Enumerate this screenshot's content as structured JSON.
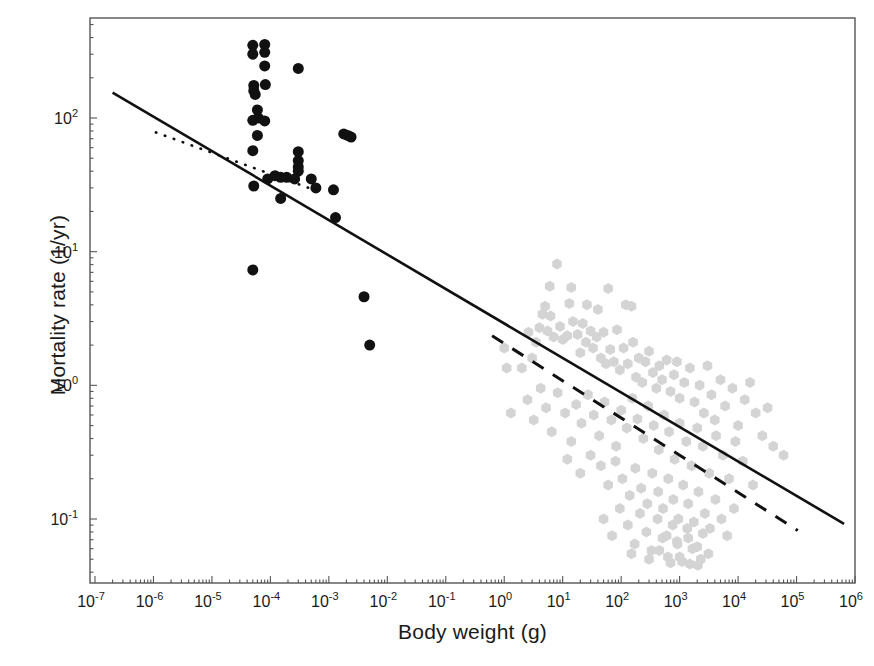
{
  "chart_data": {
    "type": "scatter",
    "title": "",
    "xlabel": "Body weight (g)",
    "ylabel": "Mortality rate (1/yr)",
    "xscale": "log",
    "yscale": "log",
    "xlim": [
      1e-07,
      1000000.0
    ],
    "ylim": [
      0.042,
      560
    ],
    "grid": false,
    "legend": "none",
    "xticks": [
      {
        "value": 1e-07,
        "label": "10",
        "exp": "-7"
      },
      {
        "value": 1e-06,
        "label": "10",
        "exp": "-6"
      },
      {
        "value": 1e-05,
        "label": "10",
        "exp": "-5"
      },
      {
        "value": 0.0001,
        "label": "10",
        "exp": "-4"
      },
      {
        "value": 0.001,
        "label": "10",
        "exp": "-3"
      },
      {
        "value": 0.01,
        "label": "10",
        "exp": "-2"
      },
      {
        "value": 0.1,
        "label": "10",
        "exp": "-1"
      },
      {
        "value": 1,
        "label": "10",
        "exp": "0"
      },
      {
        "value": 10,
        "label": "10",
        "exp": "1"
      },
      {
        "value": 100,
        "label": "10",
        "exp": "2"
      },
      {
        "value": 1000,
        "label": "10",
        "exp": "3"
      },
      {
        "value": 10000,
        "label": "10",
        "exp": "4"
      },
      {
        "value": 100000,
        "label": "10",
        "exp": "5"
      },
      {
        "value": 1000000,
        "label": "10",
        "exp": "6"
      }
    ],
    "yticks": [
      {
        "value": 100,
        "label": "10",
        "exp": "2"
      },
      {
        "value": 10,
        "label": "10",
        "exp": "1"
      },
      {
        "value": 1,
        "label": "10",
        "exp": "0"
      },
      {
        "value": 0.1,
        "label": "10",
        "exp": "-1"
      }
    ],
    "series": [
      {
        "name": "small-organisms",
        "marker": "filled-circle",
        "color": "#111111",
        "size": 11,
        "points": [
          [
            5e-05,
            350
          ],
          [
            5e-05,
            300
          ],
          [
            8e-05,
            355
          ],
          [
            8e-05,
            310
          ],
          [
            8e-05,
            245
          ],
          [
            5.2e-05,
            175
          ],
          [
            5.2e-05,
            160
          ],
          [
            5.5e-05,
            150
          ],
          [
            8.2e-05,
            178
          ],
          [
            0.0003,
            235
          ],
          [
            6e-05,
            115
          ],
          [
            6.2e-05,
            100
          ],
          [
            5e-05,
            96
          ],
          [
            8e-05,
            95
          ],
          [
            6e-05,
            74
          ],
          [
            5e-05,
            57
          ],
          [
            0.0018,
            76
          ],
          [
            0.0021,
            74
          ],
          [
            0.0024,
            72
          ],
          [
            0.0003,
            56
          ],
          [
            0.0003,
            48
          ],
          [
            0.0003,
            43
          ],
          [
            0.0003,
            40
          ],
          [
            0.00012,
            37
          ],
          [
            0.00015,
            36
          ],
          [
            0.00019,
            36
          ],
          [
            9e-05,
            35
          ],
          [
            0.00026,
            35
          ],
          [
            0.0005,
            35
          ],
          [
            5.2e-05,
            31
          ],
          [
            0.0006,
            30
          ],
          [
            0.0012,
            29
          ],
          [
            0.00015,
            25
          ],
          [
            0.0013,
            18
          ],
          [
            5e-05,
            7.3
          ],
          [
            0.004,
            4.6
          ],
          [
            0.005,
            2.0
          ]
        ]
      },
      {
        "name": "large-organisms",
        "marker": "filled-hexagon",
        "color": "#d4d4d4",
        "size": 11,
        "points": [
          [
            8.0,
            8.1
          ],
          [
            6.0,
            5.5
          ],
          [
            14.0,
            5.4
          ],
          [
            60.0,
            5.3
          ],
          [
            5.0,
            3.9
          ],
          [
            4.5,
            3.4
          ],
          [
            6.2,
            3.3
          ],
          [
            13.0,
            4.1
          ],
          [
            26.0,
            4.0
          ],
          [
            40.0,
            3.7
          ],
          [
            120.0,
            4.0
          ],
          [
            150.0,
            3.9
          ],
          [
            1.0,
            1.9
          ],
          [
            1.1,
            1.35
          ],
          [
            1.3,
            0.62
          ],
          [
            2.0,
            1.35
          ],
          [
            2.6,
            2.5
          ],
          [
            3.0,
            1.6
          ],
          [
            3.5,
            2.1
          ],
          [
            4.0,
            2.7
          ],
          [
            5.5,
            2.55
          ],
          [
            7.0,
            2.3
          ],
          [
            9.0,
            2.75
          ],
          [
            10.0,
            2.2
          ],
          [
            12.0,
            2.35
          ],
          [
            15.0,
            3.0
          ],
          [
            18.0,
            2.4
          ],
          [
            20.0,
            1.75
          ],
          [
            22.0,
            2.9
          ],
          [
            25.0,
            2.1
          ],
          [
            30.0,
            2.55
          ],
          [
            33.0,
            1.9
          ],
          [
            38.0,
            2.3
          ],
          [
            45.0,
            1.6
          ],
          [
            50.0,
            2.5
          ],
          [
            55.0,
            1.45
          ],
          [
            65.0,
            1.85
          ],
          [
            75.0,
            1.5
          ],
          [
            85.0,
            2.6
          ],
          [
            95.0,
            1.3
          ],
          [
            110.0,
            1.9
          ],
          [
            130.0,
            1.45
          ],
          [
            160.0,
            2.1
          ],
          [
            180.0,
            1.15
          ],
          [
            200.0,
            1.6
          ],
          [
            230.0,
            1.05
          ],
          [
            260.0,
            1.5
          ],
          [
            300.0,
            1.8
          ],
          [
            350.0,
            1.25
          ],
          [
            400.0,
            0.95
          ],
          [
            450.0,
            1.4
          ],
          [
            500.0,
            1.1
          ],
          [
            600.0,
            1.55
          ],
          [
            700.0,
            0.9
          ],
          [
            800.0,
            1.2
          ],
          [
            900.0,
            1.5
          ],
          [
            1000.0,
            0.8
          ],
          [
            1200.0,
            1.05
          ],
          [
            1500.0,
            1.35
          ],
          [
            1800.0,
            0.75
          ],
          [
            2200.0,
            1.0
          ],
          [
            2600.0,
            0.62
          ],
          [
            3000.0,
            1.4
          ],
          [
            3500.0,
            0.85
          ],
          [
            4000.0,
            0.55
          ],
          [
            5000.0,
            1.1
          ],
          [
            6000.0,
            0.7
          ],
          [
            8000.0,
            0.95
          ],
          [
            10000.0,
            0.5
          ],
          [
            13000.0,
            0.78
          ],
          [
            16000.0,
            1.05
          ],
          [
            20000.0,
            0.62
          ],
          [
            26000.0,
            0.42
          ],
          [
            32000.0,
            0.68
          ],
          [
            40000.0,
            0.35
          ],
          [
            60000.0,
            0.3
          ],
          [
            2.5,
            0.78
          ],
          [
            3.2,
            0.55
          ],
          [
            4.2,
            0.95
          ],
          [
            5.2,
            0.68
          ],
          [
            6.5,
            0.45
          ],
          [
            8.2,
            0.88
          ],
          [
            11.0,
            0.62
          ],
          [
            14.0,
            0.38
          ],
          [
            17.0,
            0.72
          ],
          [
            21.0,
            0.52
          ],
          [
            27.0,
            0.85
          ],
          [
            34.0,
            0.6
          ],
          [
            42.0,
            0.42
          ],
          [
            52.0,
            0.75
          ],
          [
            68.0,
            0.55
          ],
          [
            82.0,
            0.35
          ],
          [
            100.0,
            0.65
          ],
          [
            125.0,
            0.48
          ],
          [
            155.0,
            0.8
          ],
          [
            190.0,
            0.56
          ],
          [
            240.0,
            0.4
          ],
          [
            290.0,
            0.7
          ],
          [
            360.0,
            0.5
          ],
          [
            440.0,
            0.33
          ],
          [
            540.0,
            0.6
          ],
          [
            660.0,
            0.45
          ],
          [
            820.0,
            0.28
          ],
          [
            1000.0,
            0.52
          ],
          [
            1300.0,
            0.38
          ],
          [
            1600.0,
            0.25
          ],
          [
            2000.0,
            0.48
          ],
          [
            2500.0,
            0.35
          ],
          [
            3200.0,
            0.22
          ],
          [
            4200.0,
            0.42
          ],
          [
            5500.0,
            0.3
          ],
          [
            7000.0,
            0.2
          ],
          [
            9000.0,
            0.38
          ],
          [
            12000.0,
            0.27
          ],
          [
            18000.0,
            0.18
          ],
          [
            12.0,
            0.28
          ],
          [
            20.0,
            0.22
          ],
          [
            30.0,
            0.3
          ],
          [
            45.0,
            0.25
          ],
          [
            60.0,
            0.18
          ],
          [
            80.0,
            0.27
          ],
          [
            105.0,
            0.2
          ],
          [
            140.0,
            0.15
          ],
          [
            175.0,
            0.24
          ],
          [
            220.0,
            0.17
          ],
          [
            280.0,
            0.13
          ],
          [
            340.0,
            0.22
          ],
          [
            430.0,
            0.16
          ],
          [
            520.0,
            0.12
          ],
          [
            640.0,
            0.2
          ],
          [
            780.0,
            0.14
          ],
          [
            950.0,
            0.1
          ],
          [
            1150.0,
            0.18
          ],
          [
            1400.0,
            0.13
          ],
          [
            1750.0,
            0.095
          ],
          [
            2100.0,
            0.16
          ],
          [
            2700.0,
            0.11
          ],
          [
            3300.0,
            0.085
          ],
          [
            4100.0,
            0.14
          ],
          [
            5200.0,
            0.1
          ],
          [
            6500.0,
            0.075
          ],
          [
            8500.0,
            0.12
          ],
          [
            50.0,
            0.1
          ],
          [
            70.0,
            0.075
          ],
          [
            95.0,
            0.12
          ],
          [
            130.0,
            0.09
          ],
          [
            170.0,
            0.065
          ],
          [
            210.0,
            0.11
          ],
          [
            270.0,
            0.08
          ],
          [
            330.0,
            0.058
          ],
          [
            420.0,
            0.1
          ],
          [
            510.0,
            0.072
          ],
          [
            630.0,
            0.052
          ],
          [
            760.0,
            0.09
          ],
          [
            920.0,
            0.065
          ],
          [
            1100.0,
            0.048
          ],
          [
            1350.0,
            0.085
          ],
          [
            1650.0,
            0.06
          ],
          [
            2050.0,
            0.045
          ],
          [
            2500.0,
            0.078
          ],
          [
            3100.0,
            0.055
          ],
          [
            150.0,
            0.055
          ],
          [
            300.0,
            0.05
          ],
          [
            450.0,
            0.058
          ],
          [
            700.0,
            0.047
          ],
          [
            1000.0,
            0.052
          ],
          [
            1500.0,
            0.046
          ],
          [
            2300.0,
            0.05
          ],
          [
            600.0,
            0.075
          ],
          [
            900.0,
            0.068
          ],
          [
            1400.0,
            0.072
          ],
          [
            2000.0,
            0.062
          ]
        ]
      }
    ],
    "fit_lines": [
      {
        "name": "overall-fit",
        "style": "solid",
        "color": "#111111",
        "width": 2.6,
        "x_from": 2e-07,
        "y_from": 155,
        "x_to": 650000.0,
        "y_to": 0.092
      },
      {
        "name": "small-organisms-fit",
        "style": "dotted",
        "color": "#111111",
        "width": 2.6,
        "x_from": 1.1e-06,
        "y_from": 78,
        "x_to": 0.0007,
        "y_to": 28
      },
      {
        "name": "large-organisms-fit",
        "style": "dashed",
        "color": "#111111",
        "width": 3.0,
        "x_from": 0.62,
        "y_from": 2.35,
        "x_to": 105000.0,
        "y_to": 0.082
      }
    ]
  }
}
